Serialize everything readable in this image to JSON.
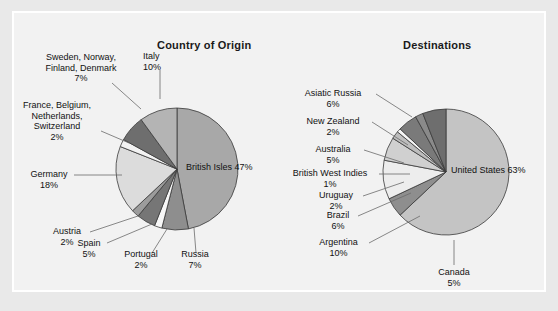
{
  "figure": {
    "background_color": "#e9e9e9",
    "panel_color": "#f2f2f2",
    "panel_border_color": "#ffffff"
  },
  "chart_data": [
    {
      "type": "pie",
      "title": "Country of Origin",
      "unit": "%",
      "total": 100,
      "legend": "none",
      "labels_position": "outside-with-leader-lines",
      "categories": [
        "British Isles",
        "Italy",
        "Sweden, Norway, Finland, Denmark",
        "France, Belgium, Netherlands, Switzerland",
        "Germany",
        "Austria",
        "Spain",
        "Portugal",
        "Russia"
      ],
      "values": [
        47,
        10,
        7,
        2,
        18,
        2,
        5,
        2,
        7
      ],
      "slices": [
        {
          "label": "British Isles",
          "pct": "47%",
          "value": 47,
          "color": "#a8a8a8"
        },
        {
          "label": "Russia",
          "pct": "7%",
          "value": 7,
          "color": "#8e8e8e"
        },
        {
          "label": "Portugal",
          "pct": "2%",
          "value": 2,
          "color": "#f7f7f7"
        },
        {
          "label": "Spain",
          "pct": "5%",
          "value": 5,
          "color": "#767676"
        },
        {
          "label": "Austria",
          "pct": "2%",
          "value": 2,
          "color": "#9c9c9c"
        },
        {
          "label": "Germany",
          "pct": "18%",
          "value": 18,
          "color": "#dcdcdc"
        },
        {
          "label": "France, Belgium, Netherlands, Switzerland",
          "pct": "2%",
          "value": 2,
          "color": "#f2f2f2"
        },
        {
          "label": "Sweden, Norway, Finland, Denmark",
          "pct": "7%",
          "value": 7,
          "color": "#6e6e6e"
        },
        {
          "label": "Italy",
          "pct": "10%",
          "value": 10,
          "color": "#b4b4b4"
        }
      ]
    },
    {
      "type": "pie",
      "title": "Destinations",
      "unit": "%",
      "total": 100,
      "legend": "none",
      "labels_position": "outside-with-leader-lines",
      "categories": [
        "United States",
        "Asiatic Russia",
        "New Zealand",
        "Australia",
        "British West Indies",
        "Uruguay",
        "Brazil",
        "Argentina",
        "Canada"
      ],
      "values": [
        63,
        6,
        2,
        5,
        1,
        2,
        6,
        10,
        5
      ],
      "slices": [
        {
          "label": "United States",
          "pct": "63%",
          "value": 63,
          "color": "#c4c4c4"
        },
        {
          "label": "Canada",
          "pct": "5%",
          "value": 5,
          "color": "#8e8e8e"
        },
        {
          "label": "Argentina",
          "pct": "10%",
          "value": 10,
          "color": "#ededed"
        },
        {
          "label": "Brazil",
          "pct": "6%",
          "value": 6,
          "color": "#d0d0d0"
        },
        {
          "label": "Uruguay",
          "pct": "2%",
          "value": 2,
          "color": "#bdbdbd"
        },
        {
          "label": "British West Indies",
          "pct": "1%",
          "value": 1,
          "color": "#f5f5f5"
        },
        {
          "label": "Australia",
          "pct": "5%",
          "value": 5,
          "color": "#7a7a7a"
        },
        {
          "label": "New Zealand",
          "pct": "2%",
          "value": 2,
          "color": "#8a8a8a"
        },
        {
          "label": "Asiatic Russia",
          "pct": "6%",
          "value": 6,
          "color": "#6e6e6e"
        }
      ]
    }
  ],
  "origin": {
    "title": "Country of Origin",
    "center_label": {
      "name": "British Isles",
      "pct": "47%"
    },
    "callouts": {
      "scandinavia": {
        "l1": "Sweden, Norway,",
        "l2": "Finland, Denmark",
        "pct": "7%"
      },
      "italy": {
        "l1": "Italy",
        "pct": "10%"
      },
      "lowlands": {
        "l1": "France, Belgium,",
        "l2": "Netherlands,",
        "l3": "Switzerland",
        "pct": "2%"
      },
      "germany": {
        "l1": "Germany",
        "pct": "18%"
      },
      "austria": {
        "l1": "Austria",
        "pct": "2%"
      },
      "spain": {
        "l1": "Spain",
        "pct": "5%"
      },
      "portugal": {
        "l1": "Portugal",
        "pct": "2%"
      },
      "russia": {
        "l1": "Russia",
        "pct": "7%"
      }
    }
  },
  "destinations": {
    "title": "Destinations",
    "center_label": {
      "name": "United States",
      "pct": "63%"
    },
    "callouts": {
      "asiatic_russia": {
        "l1": "Asiatic Russia",
        "pct": "6%"
      },
      "new_zealand": {
        "l1": "New Zealand",
        "pct": "2%"
      },
      "australia": {
        "l1": "Australia",
        "pct": "5%"
      },
      "bwi": {
        "l1": "British West Indies",
        "pct": "1%"
      },
      "uruguay": {
        "l1": "Uruguay",
        "pct": "2%"
      },
      "brazil": {
        "l1": "Brazil",
        "pct": "6%"
      },
      "argentina": {
        "l1": "Argentina",
        "pct": "10%"
      },
      "canada": {
        "l1": "Canada",
        "pct": "5%"
      }
    }
  }
}
